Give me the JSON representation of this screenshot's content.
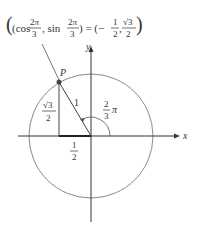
{
  "title": {
    "lhs_open": "(cos",
    "lhs_frac1_num": "2π",
    "lhs_frac1_den": "3",
    "lhs_sep": ", sin",
    "lhs_frac2_num": "2π",
    "lhs_frac2_den": "3",
    "eq": ") = (−",
    "rhs_frac1_num": "1",
    "rhs_frac1_den": "2",
    "rhs_sep": ",",
    "rhs_frac2_num": "√3",
    "rhs_frac2_den": "2",
    "rhs_close": ")"
  },
  "axes": {
    "x_label": "x",
    "y_label": "y"
  },
  "point": {
    "label": "P"
  },
  "labels": {
    "hyp": "1",
    "height_num": "√3",
    "height_den": "2",
    "base_num": "1",
    "base_den": "2",
    "angle_num": "2",
    "angle_den": "3",
    "angle_pi": "π"
  },
  "colors": {
    "circle": "#888888",
    "axis": "#333333",
    "point": "#444444"
  }
}
